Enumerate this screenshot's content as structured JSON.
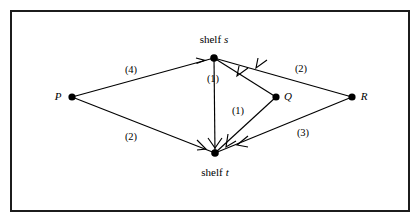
{
  "figure": {
    "kind": "directed-flow-network-diagram",
    "border_color": "#1c1c1c",
    "background": "#ffffff",
    "line_color": "#000000"
  },
  "nodes": [
    {
      "id": "P",
      "label": "P",
      "label_style": "italic",
      "x": 72,
      "y": 97,
      "label_x": 58,
      "label_y": 96,
      "label_anchor": "right"
    },
    {
      "id": "s",
      "label": "shelf",
      "label_italic": "s",
      "x": 214,
      "y": 58,
      "label_x": 214,
      "label_y": 39,
      "label_anchor": "center"
    },
    {
      "id": "Q",
      "label": "Q",
      "label_style": "italic",
      "x": 276,
      "y": 97,
      "label_x": 288,
      "label_y": 96,
      "label_anchor": "left"
    },
    {
      "id": "R",
      "label": "R",
      "label_style": "italic",
      "x": 352,
      "y": 97,
      "label_x": 364,
      "label_y": 96,
      "label_anchor": "left"
    },
    {
      "id": "t",
      "label": "shelf",
      "label_italic": "t",
      "x": 215,
      "y": 153,
      "label_x": 215,
      "label_y": 172,
      "label_anchor": "center"
    }
  ],
  "edges": [
    {
      "from": "P",
      "to": "s",
      "capacity": "(4)",
      "label_x": 131,
      "label_y": 70
    },
    {
      "from": "P",
      "to": "t",
      "capacity": "(2)",
      "label_x": 131,
      "label_y": 137
    },
    {
      "from": "s",
      "to": "t",
      "capacity": "(1)",
      "label_x": 213,
      "label_y": 79
    },
    {
      "from": "Q",
      "to": "s",
      "capacity": "(1)",
      "label_x": 238,
      "label_y": 111
    },
    {
      "from": "R",
      "to": "s",
      "capacity": "(2)",
      "label_x": 301,
      "label_y": 69
    },
    {
      "from": "R",
      "to": "t",
      "capacity": "(3)",
      "label_x": 303,
      "label_y": 133
    }
  ],
  "edge_labels": {
    "p_s": "(4)",
    "p_t": "(2)",
    "s_t": "(1)",
    "q_st": "(1)",
    "r_s": "(2)",
    "r_t": "(3)"
  },
  "node_labels": {
    "p": "P",
    "q": "Q",
    "r": "R",
    "shelf_s_word": "shelf",
    "shelf_s_letter": "s",
    "shelf_t_word": "shelf",
    "shelf_t_letter": "t"
  }
}
